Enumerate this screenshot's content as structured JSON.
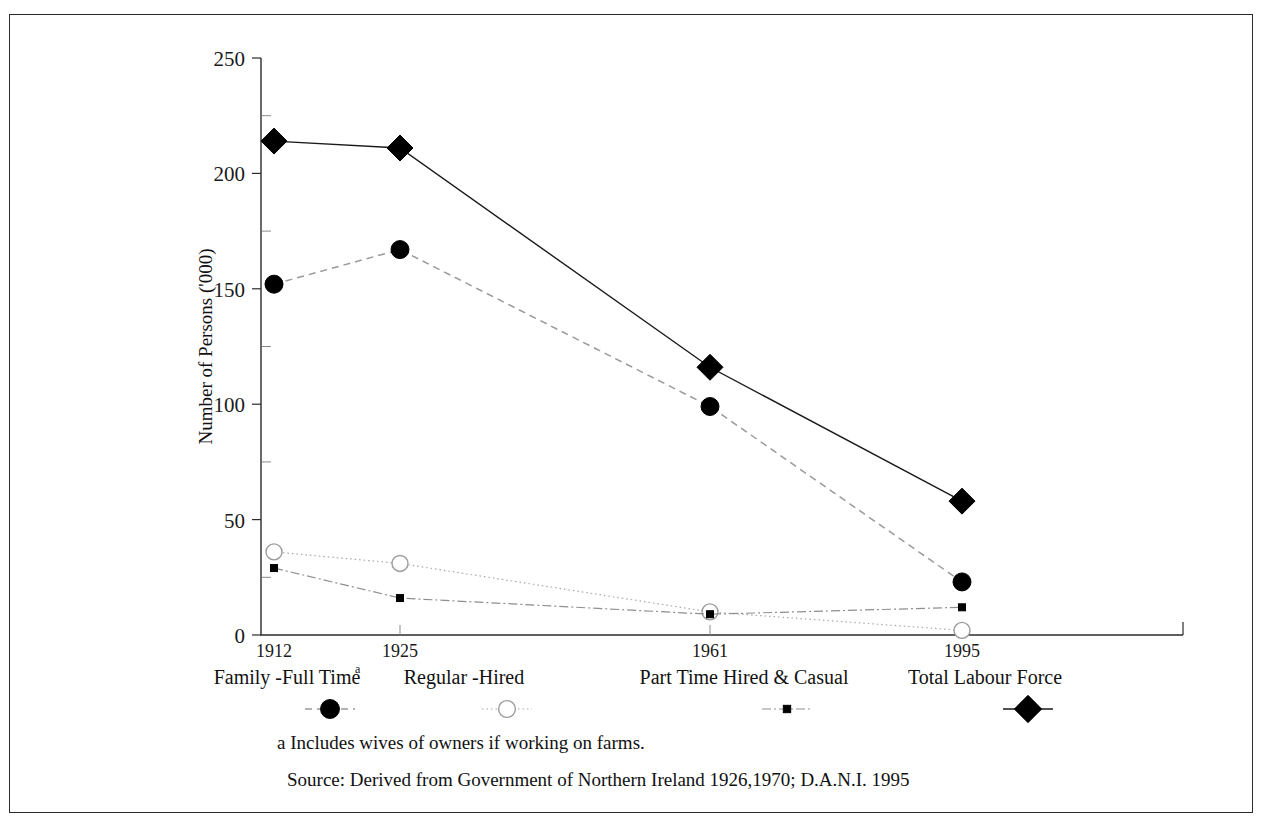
{
  "figure": {
    "border_color": "#2b2b2b"
  },
  "chart_data": {
    "type": "line",
    "title": "",
    "xlabel": "",
    "ylabel": "Number of Persons ('000)",
    "categories": [
      "1912",
      "1925",
      "1961",
      "1995"
    ],
    "x_positions": [
      1912,
      1925,
      1961,
      1995
    ],
    "xlim": [
      1912,
      1995
    ],
    "ylim": [
      0,
      250
    ],
    "y_ticks": [
      0,
      50,
      100,
      150,
      200,
      250
    ],
    "y_tick_labels": [
      "0",
      "50",
      "100",
      "150",
      "200",
      "250"
    ],
    "y_minor_ticks": [
      25,
      75,
      125,
      175,
      225
    ],
    "grid": false,
    "legend_position": "below-axis",
    "series": [
      {
        "name": "Family -Full Time",
        "footnote_marker": "a",
        "marker": "filled-circle",
        "line_style": "dashed",
        "color": "#000000",
        "line_color": "#9a9a9a",
        "values": [
          152,
          167,
          99,
          23
        ]
      },
      {
        "name": "Regular -Hired",
        "footnote_marker": "",
        "marker": "open-circle",
        "line_style": "dotted",
        "color": "#ffffff",
        "line_color": "#a8a8a8",
        "values": [
          36,
          31,
          10,
          2
        ]
      },
      {
        "name": "Part Time Hired & Casual",
        "footnote_marker": "",
        "marker": "filled-square",
        "line_style": "dash-dot",
        "color": "#000000",
        "line_color": "#8f8f8f",
        "values": [
          29,
          16,
          9,
          12
        ]
      },
      {
        "name": "Total Labour Force",
        "footnote_marker": "",
        "marker": "filled-diamond",
        "line_style": "solid",
        "color": "#000000",
        "line_color": "#1a1a1a",
        "values": [
          214,
          211,
          116,
          58
        ]
      }
    ],
    "annotations": [
      "a  Includes wives  of owners if working on farms.",
      "Source:  Derived from Government of Northern Ireland 1926,1970; D.A.N.I.  1995"
    ]
  },
  "notes": {
    "footnote": "a  Includes wives  of owners if working on farms.",
    "source": "Source:  Derived from Government of Northern Ireland 1926,1970; D.A.N.I.  1995"
  }
}
